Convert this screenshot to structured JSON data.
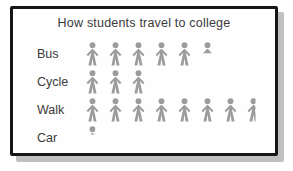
{
  "chart_data": {
    "type": "bar",
    "style": "pictograph",
    "title": "How students travel to college",
    "categories": [
      "Bus",
      "Cycle",
      "Walk",
      "Car"
    ],
    "values": [
      5.5,
      3,
      7.5,
      0.25
    ],
    "value_unit": "person-symbols",
    "legend_position": "none",
    "grid": false,
    "rows": [
      {
        "label": "Bus",
        "full_icons": 5,
        "partial_icon": "upper-half"
      },
      {
        "label": "Cycle",
        "full_icons": 3,
        "partial_icon": "none"
      },
      {
        "label": "Walk",
        "full_icons": 7,
        "partial_icon": "vertical-half"
      },
      {
        "label": "Car",
        "full_icons": 0,
        "partial_icon": "head-quarter"
      }
    ]
  },
  "colors": {
    "icon": "#9c9c9c",
    "text": "#3a3a3a",
    "panel_border": "#161616",
    "panel_shadow": "#c0c0c0",
    "panel_background": "#fefefe"
  }
}
